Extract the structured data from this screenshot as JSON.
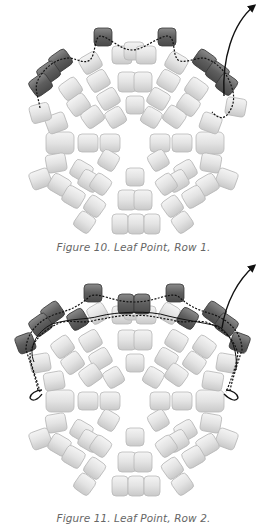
{
  "figures": [
    {
      "caption": "Figure 10. Leaf Point, Row 1.",
      "arrow": "thread-exit-arrow"
    },
    {
      "caption": "Figure 11. Leaf Point, Row 2.",
      "arrow": "thread-exit-arrow"
    }
  ],
  "colors": {
    "bead_light": "#e4e4e4",
    "bead_light_edge": "#b5b5b5",
    "bead_dark": "#6e6e6e",
    "bead_dark_edge": "#3a3a3a",
    "thread": "#111111",
    "caption": "#666666"
  }
}
